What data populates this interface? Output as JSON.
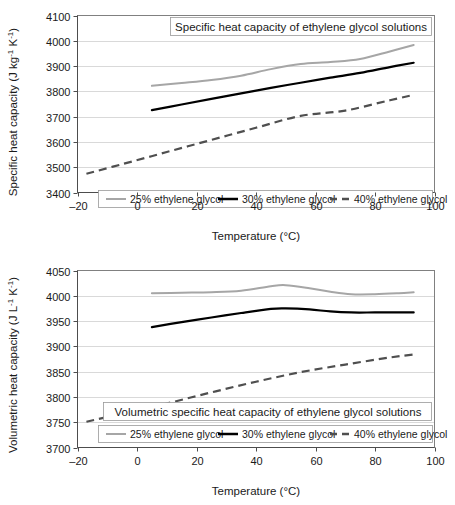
{
  "figure": {
    "background": "#ffffff",
    "width": 455,
    "height": 505
  },
  "colors": {
    "series_25": "#a6a6a6",
    "series_30": "#000000",
    "series_40": "#4f4f4f",
    "gridline": "#d9d9d9",
    "axis": "#4d4d4d",
    "text": "#1a1a1a"
  },
  "legend_labels": {
    "s25": "25% ethylene glycol",
    "s30": "30% ethylene glycol",
    "s40": "40% ethylene glycol"
  },
  "shared": {
    "xlabel": "Temperature (°C)",
    "x_ticks": [
      "-20",
      "0",
      "20",
      "40",
      "60",
      "80",
      "100"
    ]
  },
  "chart_data": [
    {
      "id": "specific-heat-capacity",
      "type": "line",
      "title": "Specific heat capacity of ethylene glycol solutions",
      "xlabel": "Temperature (°C)",
      "ylabel": "Specific heat capacity (J kg⁻¹ K⁻¹)",
      "ylabel_plain": "Specific heat capacity (J kg-1 K-1)",
      "xlim": [
        -20,
        100
      ],
      "ylim": [
        3400,
        4100
      ],
      "x_ticks": [
        -20,
        0,
        20,
        40,
        60,
        80,
        100
      ],
      "y_ticks": [
        3400,
        3500,
        3600,
        3700,
        3800,
        3900,
        4000,
        4100
      ],
      "grid": "horizontal",
      "legend_position": "bottom-inside",
      "series": [
        {
          "name": "25% ethylene glycol",
          "style": "solid",
          "color": "#a6a6a6",
          "x": [
            5,
            15,
            25,
            35,
            45,
            55,
            65,
            75,
            85,
            93
          ],
          "values": [
            3822,
            3833,
            3845,
            3862,
            3888,
            3908,
            3916,
            3928,
            3958,
            3983
          ]
        },
        {
          "name": "30% ethylene glycol",
          "style": "solid",
          "color": "#000000",
          "x": [
            5,
            15,
            25,
            35,
            45,
            55,
            65,
            75,
            85,
            93
          ],
          "values": [
            3726,
            3748,
            3770,
            3792,
            3814,
            3834,
            3854,
            3873,
            3896,
            3913
          ]
        },
        {
          "name": "40% ethylene glycol",
          "style": "dashed",
          "color": "#4f4f4f",
          "x": [
            -17,
            -5,
            10,
            25,
            40,
            55,
            70,
            85,
            93
          ],
          "values": [
            3474,
            3512,
            3560,
            3608,
            3656,
            3703,
            3724,
            3765,
            3786
          ]
        }
      ]
    },
    {
      "id": "volumetric-heat-capacity",
      "type": "line",
      "title": "Volumetric specific heat capacity of ethylene glycol solutions",
      "xlabel": "Temperature (°C)",
      "ylabel": "Volumetric heat capacity (J L⁻¹ K⁻¹)",
      "ylabel_plain": "Volumetric heat capacity (J L-1 K-1)",
      "xlim": [
        -20,
        100
      ],
      "ylim": [
        3700,
        4050
      ],
      "x_ticks": [
        -20,
        0,
        20,
        40,
        60,
        80,
        100
      ],
      "y_ticks": [
        3700,
        3750,
        3800,
        3850,
        3900,
        3950,
        4000,
        4050
      ],
      "grid": "horizontal",
      "legend_position": "bottom-inside",
      "series": [
        {
          "name": "25% ethylene glycol",
          "style": "solid",
          "color": "#a6a6a6",
          "x": [
            5,
            15,
            25,
            35,
            45,
            50,
            58,
            65,
            72,
            80,
            88,
            93
          ],
          "values": [
            4005,
            4006,
            4007,
            4010,
            4019,
            4021,
            4015,
            4008,
            4003,
            4003,
            4005,
            4007
          ]
        },
        {
          "name": "30% ethylene glycol",
          "style": "solid",
          "color": "#000000",
          "x": [
            5,
            15,
            25,
            35,
            45,
            50,
            58,
            65,
            72,
            80,
            88,
            93
          ],
          "values": [
            3938,
            3948,
            3957,
            3966,
            3974,
            3975,
            3973,
            3969,
            3967,
            3967,
            3967,
            3967
          ]
        },
        {
          "name": "40% ethylene glycol",
          "style": "dashed",
          "color": "#4f4f4f",
          "x": [
            -17,
            -5,
            10,
            25,
            40,
            55,
            70,
            85,
            93
          ],
          "values": [
            3751,
            3767,
            3787,
            3809,
            3830,
            3849,
            3864,
            3878,
            3884
          ]
        }
      ]
    }
  ]
}
